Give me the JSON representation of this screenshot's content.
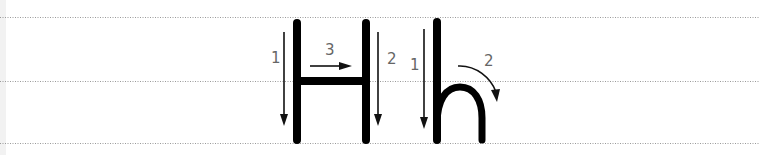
{
  "worksheet": {
    "letters": [
      {
        "character_upper": "H",
        "strokes": [
          {
            "order": "1",
            "direction": "down"
          },
          {
            "order": "2",
            "direction": "down"
          },
          {
            "order": "3",
            "direction": "right"
          }
        ]
      },
      {
        "character_lower": "h",
        "strokes": [
          {
            "order": "1",
            "direction": "down"
          },
          {
            "order": "2",
            "direction": "curve-down-right"
          }
        ]
      }
    ],
    "guide_lines": [
      "top",
      "middle",
      "baseline"
    ],
    "colors": {
      "letter": "#000000",
      "arrow": "#111111",
      "number": "#666666",
      "guide": "#9a9a9a",
      "background": "#ffffff"
    }
  }
}
